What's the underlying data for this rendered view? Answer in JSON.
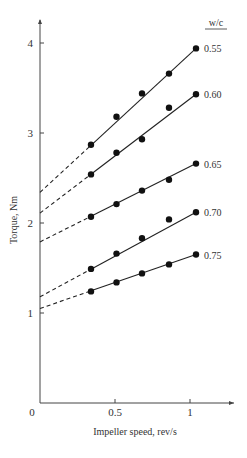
{
  "chart_data": {
    "type": "line",
    "title": "",
    "xlabel": "Impeller speed, rev/s",
    "ylabel": "Torque, Nm",
    "xlim": [
      0,
      1.3
    ],
    "ylim": [
      0,
      4.3
    ],
    "x_ticks": [
      0,
      0.5,
      1
    ],
    "x_tick_labels": [
      "0",
      "0.5",
      "1"
    ],
    "y_ticks": [
      1,
      2,
      3,
      4
    ],
    "y_tick_labels": [
      "1",
      "2",
      "3",
      "4"
    ],
    "grid": false,
    "legend_title": "w/c",
    "legend_position": "right-end-of-lines",
    "x": [
      0.34,
      0.51,
      0.68,
      0.86,
      1.04
    ],
    "series": [
      {
        "name": "0.55",
        "values": [
          2.87,
          3.18,
          3.44,
          3.66,
          3.94
        ],
        "intercept": 2.34
      },
      {
        "name": "0.60",
        "values": [
          2.54,
          2.78,
          2.93,
          3.28,
          3.43
        ],
        "intercept": 2.11
      },
      {
        "name": "0.65",
        "values": [
          2.07,
          2.21,
          2.36,
          2.48,
          2.66
        ],
        "intercept": 1.79
      },
      {
        "name": "0.70",
        "values": [
          1.49,
          1.66,
          1.83,
          2.04,
          2.12
        ],
        "intercept": 1.18
      },
      {
        "name": "0.75",
        "values": [
          1.24,
          1.34,
          1.44,
          1.54,
          1.65
        ],
        "intercept": 1.05
      }
    ]
  },
  "colors": {
    "line": "#222222",
    "marker": "#111111",
    "axis": "#444444"
  }
}
